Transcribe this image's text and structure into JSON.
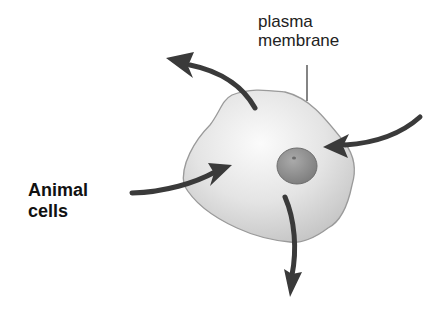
{
  "diagram": {
    "labels": {
      "plasma_membrane_line1": "plasma",
      "plasma_membrane_line2": "membrane",
      "animal_cells_line1": "Animal",
      "animal_cells_line2": "cells"
    },
    "arrows": [
      {
        "direction": "out",
        "position": "top-left"
      },
      {
        "direction": "in",
        "position": "right"
      },
      {
        "direction": "in",
        "position": "left"
      },
      {
        "direction": "out",
        "position": "bottom"
      }
    ],
    "colors": {
      "cell_fill": "#e6e6e6",
      "cell_outline": "#9a9a9a",
      "nucleus": "#8a8a8a",
      "arrow": "#3a3a3a"
    }
  }
}
